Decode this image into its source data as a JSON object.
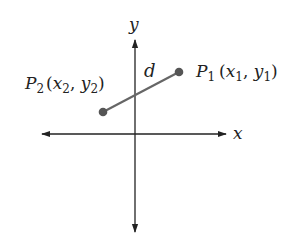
{
  "diagram": {
    "colors": {
      "background": "#ffffff",
      "axis": "#222222",
      "segment": "#666666",
      "point": "#555555",
      "text": "#222222"
    },
    "axes": {
      "x_label": "x",
      "y_label": "y",
      "origin": {
        "px": 135,
        "py": 134
      },
      "x_extent": {
        "left": 42,
        "right": 226
      },
      "y_extent": {
        "top": 40,
        "bottom": 232
      }
    },
    "points": [
      {
        "id": "P1",
        "name": "P",
        "subscript": "1",
        "coords_label": {
          "open": "(",
          "x": "x",
          "x_sub": "1",
          "sep": ", ",
          "y": "y",
          "y_sub": "1",
          "close": ")"
        },
        "px": 179,
        "py": 72
      },
      {
        "id": "P2",
        "name": "P",
        "subscript": "2",
        "coords_label": {
          "open": "(",
          "x": "x",
          "x_sub": "2",
          "sep": ", ",
          "y": "y",
          "y_sub": "2",
          "close": ")"
        },
        "px": 103,
        "py": 112
      }
    ],
    "segment": {
      "label": "d",
      "from": "P2",
      "to": "P1"
    }
  }
}
